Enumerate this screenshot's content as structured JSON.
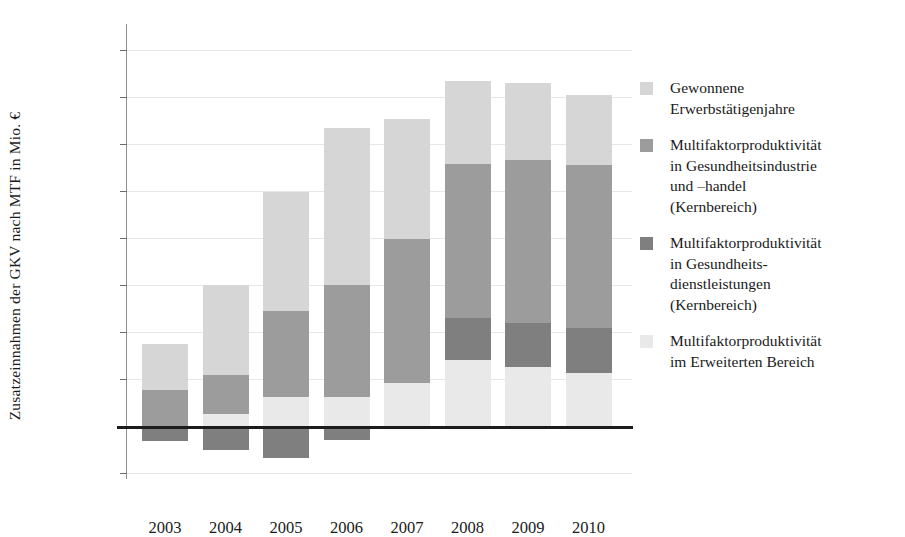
{
  "chart_data": {
    "type": "bar",
    "title": "",
    "xlabel": "",
    "ylabel": "Zusatzeinnahmen der GKV nach MTF in Mio. €",
    "categories": [
      "2003",
      "2004",
      "2005",
      "2006",
      "2007",
      "2008",
      "2009",
      "2010"
    ],
    "ylim": [
      -200,
      1600
    ],
    "ytick_labels": [
      "1.600",
      "1.400",
      "1.200",
      "1.000",
      "800",
      "600",
      "400",
      "200",
      "0",
      "-200"
    ],
    "ytick_values": [
      1600,
      1400,
      1200,
      1000,
      800,
      600,
      400,
      200,
      0,
      -200
    ],
    "grid": true,
    "stacked": true,
    "legend_position": "right",
    "series": [
      {
        "name": "Gewonnene Erwerbstätigenjahre",
        "color": "#d6d6d6",
        "values": [
          195,
          385,
          505,
          670,
          510,
          355,
          330,
          300
        ]
      },
      {
        "name": "Multifaktorproduktivität in Gesundheitsindustrie und –handel (Kernbereich)",
        "color": "#9c9c9c",
        "values": [
          155,
          165,
          365,
          475,
          610,
          655,
          690,
          695
        ]
      },
      {
        "name": "Multifaktorproduktivität in Gesundheitsdienstleistungen (Kernbereich)",
        "color": "#7f7f7f",
        "values": [
          -65,
          -100,
          -135,
          -60,
          0,
          180,
          190,
          190
        ]
      },
      {
        "name": "Multifaktorproduktivität im Erweiterten Bereich",
        "color": "#e9e9e9",
        "values": [
          0,
          50,
          125,
          125,
          185,
          280,
          250,
          225
        ]
      }
    ],
    "totals_positive": [
      350,
      600,
      1000,
      1270,
      1305,
      1510,
      1520,
      1525
    ]
  },
  "legend": {
    "items": [
      {
        "label": "Gewonnene Erwerbstätigenjahre",
        "color": "#d6d6d6",
        "swatch": "legend-swatch-gained"
      },
      {
        "label": "Multifaktorproduktivität in Gesundheitsindustrie und –handel (Kernbereich)",
        "color": "#9c9c9c",
        "swatch": "legend-swatch-industry"
      },
      {
        "label": "Multifaktorproduktivität in Gesundheits- dienstleistungen (Kernbereich)",
        "color": "#7f7f7f",
        "swatch": "legend-swatch-services"
      },
      {
        "label": "Multifaktorproduktivität im Erweiterten Bereich",
        "color": "#e9e9e9",
        "swatch": "legend-swatch-extended"
      }
    ],
    "lines": [
      [
        "Gewonnene",
        "Erwerbstätigenjahre"
      ],
      [
        "Multifaktorproduktivität",
        "in Gesundheitsindustrie",
        "und –handel",
        "(Kernbereich)"
      ],
      [
        "Multifaktorproduktivität",
        "in Gesundheits-",
        "dienstleistungen",
        "(Kernbereich)"
      ],
      [
        "Multifaktorproduktivität",
        "im Erweiterten Bereich"
      ]
    ]
  },
  "colors": {
    "grid": "#e7e7e7",
    "axis": "#8e8e8e",
    "zero_line": "#1c1c1c",
    "text": "#1a1a1a",
    "background": "#ffffff"
  }
}
